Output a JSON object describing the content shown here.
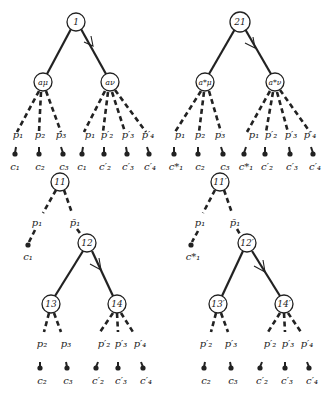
{
  "diagram": {
    "trees": [
      {
        "id": "tree-1",
        "root": "1",
        "children": [
          "a_μ",
          "a_ν"
        ],
        "arrow_on": "right-edge",
        "branches": [
          {
            "node": "a_μ",
            "edges": [
              {
                "p": "p1",
                "c": "c1"
              },
              {
                "p": "p2",
                "c": "c2"
              },
              {
                "p": "p3",
                "c": "c3"
              }
            ]
          },
          {
            "node": "a_ν",
            "edges": [
              {
                "p": "p1",
                "c": "c1"
              },
              {
                "p": "p2'",
                "c": "c2'"
              },
              {
                "p": "p3'",
                "c": "c3'"
              },
              {
                "p": "p4'",
                "c": "c4'"
              }
            ]
          }
        ]
      },
      {
        "id": "tree-2",
        "root": "21",
        "children": [
          "a*_μ",
          "a*_ν"
        ],
        "arrow_on": "right-edge",
        "branches": [
          {
            "node": "a*_μ",
            "edges": [
              {
                "p": "p1",
                "c": "c1*"
              },
              {
                "p": "p2",
                "c": "c2"
              },
              {
                "p": "p3",
                "c": "c3"
              }
            ]
          },
          {
            "node": "a*_ν",
            "edges": [
              {
                "p": "p1",
                "c": "c1*"
              },
              {
                "p": "p2'",
                "c": "c2'"
              },
              {
                "p": "p3'",
                "c": "c3'"
              },
              {
                "p": "p4'",
                "c": "c4'"
              }
            ]
          }
        ]
      },
      {
        "id": "tree-3",
        "root": "11",
        "edges": [
          {
            "p": "p1",
            "c": "c1"
          },
          {
            "p": "p̄1",
            "to": "12"
          }
        ],
        "sub": {
          "node": "12",
          "children": [
            "13",
            "14"
          ],
          "arrow_on": "right-edge"
        },
        "branches": [
          {
            "node": "13",
            "edges": [
              {
                "p": "p2",
                "c": "c2"
              },
              {
                "p": "p3",
                "c": "c3"
              }
            ]
          },
          {
            "node": "14",
            "edges": [
              {
                "p": "p2'",
                "c": "c2'"
              },
              {
                "p": "p3'",
                "c": "c3'"
              },
              {
                "p": "p4'",
                "c": "c4'"
              }
            ]
          }
        ]
      },
      {
        "id": "tree-4",
        "root": "11'",
        "edges": [
          {
            "p": "p1",
            "c": "c1*"
          },
          {
            "p": "p̄1",
            "to": "12'"
          }
        ],
        "sub": {
          "node": "12'",
          "children": [
            "13'",
            "14'"
          ],
          "arrow_on": "right-edge"
        },
        "branches": [
          {
            "node": "13'",
            "edges": [
              {
                "p": "p2'",
                "c": "c2"
              },
              {
                "p": "p3'",
                "c": "c3"
              }
            ]
          },
          {
            "node": "14'",
            "edges": [
              {
                "p": "p2'",
                "c": "c2'"
              },
              {
                "p": "p3'",
                "c": "c3'"
              },
              {
                "p": "p4'",
                "c": "c4'"
              }
            ]
          }
        ]
      }
    ]
  },
  "labels": {
    "n1": "1",
    "n21": "21",
    "n11": "11",
    "n12": "12",
    "n13": "13",
    "n14": "14",
    "n11p": "11′",
    "n12p": "12′",
    "n13p": "13′",
    "n14p": "14′",
    "amu": "aμ",
    "anu": "aν",
    "amus": "a*μ",
    "anus": "a*ν",
    "p1": "p₁",
    "p2": "p₂",
    "p3": "p₃",
    "p2p": "p′₂",
    "p3p": "p′₃",
    "p4p": "p′₄",
    "p1bar": "p̄₁",
    "c1": "c₁",
    "c2": "c₂",
    "c3": "c₃",
    "c1s": "c*₁",
    "c2p": "c′₂",
    "c3p": "c′₃",
    "c4p": "c′₄"
  }
}
